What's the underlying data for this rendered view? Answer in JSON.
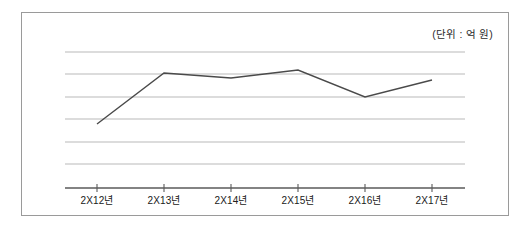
{
  "figure": {
    "background_color": "#ffffff",
    "frame_color": "#9a9a9a",
    "annotation": "(단위 : 억 원)"
  },
  "chart_data": {
    "type": "line",
    "title": "",
    "subtitle": "",
    "xlabel": "",
    "ylabel": "",
    "annotations": [
      "(단위 : 억 원)"
    ],
    "unit": "억 원",
    "grid": true,
    "gridlines": 6,
    "legend": "none",
    "legend_position": "none",
    "axis_tick_labels_shown": "x-only",
    "y_axis_labels_shown": false,
    "categories": [
      "2X12년",
      "2X13년",
      "2X14년",
      "2X15년",
      "2X16년",
      "2X17년"
    ],
    "x": [
      "2X12년",
      "2X13년",
      "2X14년",
      "2X15년",
      "2X16년",
      "2X17년"
    ],
    "series": [
      {
        "name": "매출액",
        "color": "#4a4a4a",
        "values": [
          2.0,
          4.2,
          4.0,
          4.4,
          3.3,
          3.9
        ]
      }
    ],
    "values": [
      2.0,
      4.2,
      4.0,
      4.4,
      3.3,
      3.9
    ],
    "ylim": [
      0.0,
      6.0
    ],
    "y_gridline_values": [
      6.0,
      5.0,
      4.0,
      3.0,
      2.0,
      1.0
    ],
    "pixel_geometry": {
      "plot_left": 65,
      "plot_right": 465,
      "axis_y": 188,
      "gridline_y": [
        52,
        74,
        97,
        119,
        142,
        164
      ],
      "tick_x": [
        97,
        164,
        231,
        298,
        365,
        432
      ],
      "point_y": [
        124,
        73,
        78,
        70,
        97,
        80
      ]
    },
    "colors": {
      "line": "#4a4a4a",
      "grid": "#b9b9b9",
      "axis": "#5a5a5a",
      "frame": "#9a9a9a",
      "text": "#202020"
    }
  }
}
